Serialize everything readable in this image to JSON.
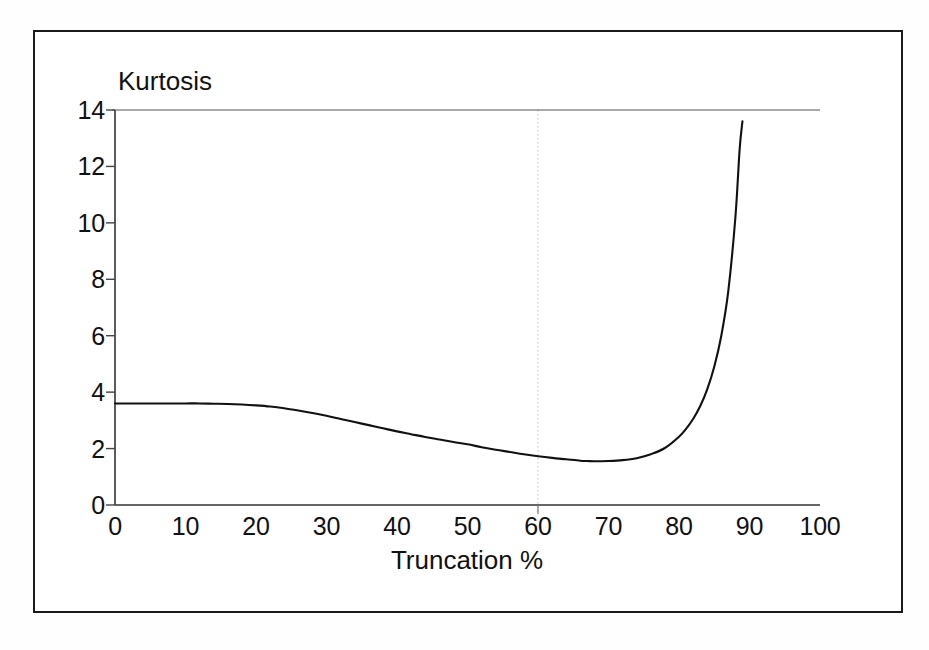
{
  "chart_data": {
    "type": "line",
    "title": "",
    "xlabel": "Truncation %",
    "ylabel": "Kurtosis",
    "xlim": [
      0,
      100
    ],
    "ylim": [
      0,
      14
    ],
    "xticks": [
      0,
      10,
      20,
      30,
      40,
      50,
      60,
      70,
      80,
      90,
      100
    ],
    "yticks": [
      0,
      2,
      4,
      6,
      8,
      10,
      12,
      14
    ],
    "xtick_labels": [
      "0",
      "10",
      "20",
      "30",
      "40",
      "50",
      "60",
      "70",
      "80",
      "90",
      "100"
    ],
    "ytick_labels": [
      "0",
      "2",
      "4",
      "6",
      "8",
      "10",
      "12",
      "14"
    ],
    "grid": false,
    "legend": null,
    "line_color": "#111111",
    "series": [
      {
        "name": "Kurtosis",
        "x": [
          0,
          2,
          4,
          6,
          8,
          10,
          12,
          14,
          16,
          18,
          20,
          22,
          24,
          26,
          28,
          30,
          32,
          34,
          36,
          38,
          40,
          42,
          44,
          46,
          48,
          50,
          52,
          54,
          56,
          58,
          60,
          62,
          64,
          66,
          67,
          68,
          70,
          72,
          74,
          76,
          78,
          80,
          81,
          82,
          83,
          84,
          85,
          86,
          87,
          88,
          88.6,
          89
        ],
        "y": [
          3.6,
          3.6,
          3.6,
          3.6,
          3.6,
          3.6,
          3.6,
          3.59,
          3.58,
          3.56,
          3.53,
          3.49,
          3.43,
          3.35,
          3.26,
          3.16,
          3.05,
          2.94,
          2.83,
          2.72,
          2.61,
          2.51,
          2.41,
          2.32,
          2.23,
          2.15,
          2.05,
          1.96,
          1.88,
          1.8,
          1.73,
          1.67,
          1.62,
          1.57,
          1.56,
          1.55,
          1.56,
          1.59,
          1.66,
          1.8,
          2.02,
          2.42,
          2.7,
          3.05,
          3.5,
          4.1,
          4.9,
          6.0,
          7.6,
          10.2,
          12.6,
          13.6
        ]
      }
    ],
    "annotations": [
      {
        "name": "reference-line",
        "type": "vertical-dotted",
        "x": 60,
        "color": "#cccccc"
      }
    ]
  },
  "axis_titles": {
    "y": "Kurtosis",
    "x": "Truncation %"
  }
}
